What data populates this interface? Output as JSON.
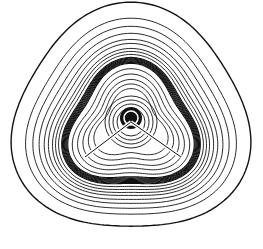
{
  "diagram": {
    "type": "contour-map",
    "colors": {
      "background": "#ffffff",
      "line": "#111111"
    },
    "center": {
      "x": 131,
      "y": 118
    },
    "outer_contour_count": 9,
    "inner_contour_count": 10,
    "bond_lines": [
      {
        "from": [
          131,
          122
        ],
        "to": [
          85,
          157
        ]
      },
      {
        "from": [
          131,
          122
        ],
        "to": [
          181,
          157
        ]
      }
    ]
  }
}
